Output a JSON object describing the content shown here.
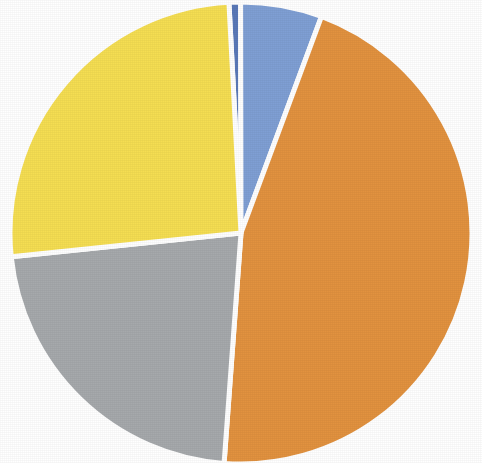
{
  "chart_data": {
    "type": "pie",
    "title": "",
    "subtitle": "",
    "xlabel": "",
    "ylabel": "",
    "legend_position": "none",
    "grid": false,
    "labels_shown": false,
    "categories": [
      "Slice 1",
      "Slice 2",
      "Slice 3",
      "Slice 4",
      "Slice 5"
    ],
    "values": [
      0.8,
      5.7,
      45.5,
      22.2,
      25.8
    ],
    "colors": [
      "#5A79B8",
      "#7F9FD4",
      "#E2923F",
      "#A6A9AC",
      "#F5DE52"
    ],
    "start_angle_deg": -3.0,
    "direction": "clockwise",
    "slices": [
      {
        "name": "Slice 1",
        "color": "#5A79B8",
        "value": 0.8,
        "percent": "0.8%",
        "start_angle_deg": -3.0,
        "end_angle_deg": -0.1
      },
      {
        "name": "Slice 2",
        "color": "#7F9FD4",
        "value": 5.7,
        "percent": "5.7%",
        "start_angle_deg": -0.1,
        "end_angle_deg": 20.4
      },
      {
        "name": "Slice 3",
        "color": "#E2923F",
        "value": 45.5,
        "percent": "45.5%",
        "start_angle_deg": 20.4,
        "end_angle_deg": 184.2
      },
      {
        "name": "Slice 4",
        "color": "#A6A9AC",
        "value": 22.2,
        "percent": "22.2%",
        "start_angle_deg": 184.2,
        "end_angle_deg": 264.1
      },
      {
        "name": "Slice 5",
        "color": "#F5DE52",
        "value": 25.8,
        "percent": "25.8%",
        "start_angle_deg": 264.1,
        "end_angle_deg": 357.0
      }
    ],
    "geometry": {
      "center_x": 241,
      "center_y": 233,
      "radius": 231,
      "separator_color": "#FFFFFF",
      "separator_width": 5
    },
    "background_color": "#FFFFFF"
  }
}
